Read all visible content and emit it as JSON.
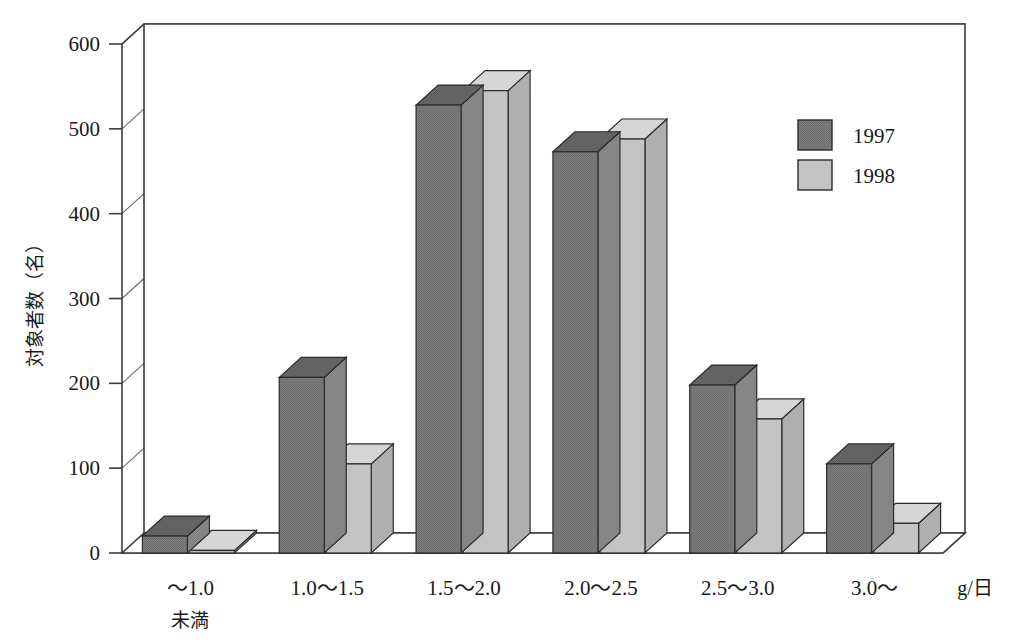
{
  "chart_data": {
    "type": "bar",
    "title": "",
    "xlabel": "g/日",
    "ylabel": "対象者数（名）",
    "ylim": [
      0,
      600
    ],
    "ytick_step": 100,
    "yticks": [
      "0",
      "100",
      "200",
      "300",
      "400",
      "500",
      "600"
    ],
    "grid": true,
    "style": "3d-clustered-column",
    "legend_position": "top-right",
    "categories": [
      "〜1.0",
      "1.0〜1.5",
      "1.5〜2.0",
      "2.0〜2.5",
      "2.5〜3.0",
      "3.0〜"
    ],
    "category_sublabels": [
      "未満",
      "",
      "",
      "",
      "",
      ""
    ],
    "series": [
      {
        "name": "1997",
        "color": "#7a7a7a",
        "values": [
          20,
          207,
          528,
          473,
          198,
          105
        ]
      },
      {
        "name": "1998",
        "color": "#c8c8c8",
        "values": [
          3,
          105,
          545,
          488,
          158,
          35
        ]
      }
    ]
  },
  "legend": {
    "entries": [
      {
        "label": "1997",
        "swatch": "dark-gray-swatch"
      },
      {
        "label": "1998",
        "swatch": "light-gray-swatch"
      }
    ]
  },
  "axis": {
    "y_title": "対象者数（名）",
    "x_unit": "g/日",
    "tick_0": "0",
    "tick_100": "100",
    "tick_200": "200",
    "tick_300": "300",
    "tick_400": "400",
    "tick_500": "500",
    "tick_600": "600"
  },
  "categories_text": {
    "c0": "〜1.0",
    "c0_sub": "未満",
    "c1": "1.0〜1.5",
    "c2": "1.5〜2.0",
    "c3": "2.0〜2.5",
    "c4": "2.5〜3.0",
    "c5": "3.0〜"
  },
  "colors": {
    "series_1997": "#7a7a7a",
    "series_1998": "#c8c8c8",
    "axis_line": "#3b3b3b",
    "grid_line": "#555555",
    "background": "#ffffff"
  }
}
